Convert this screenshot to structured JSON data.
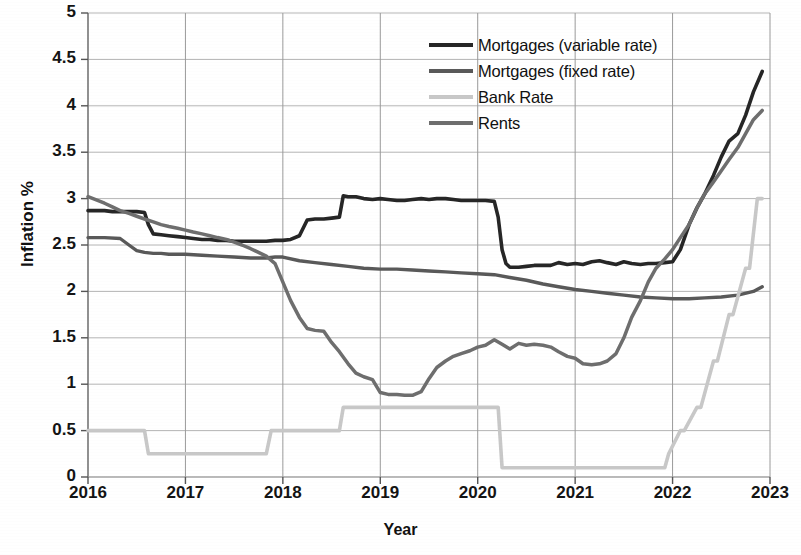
{
  "chart_data": {
    "type": "line",
    "title": "",
    "xlabel": "Year",
    "ylabel": "Inflation %",
    "xlim": [
      2016,
      2023
    ],
    "ylim": [
      0,
      5
    ],
    "grid": true,
    "legend_position": "top-center-right",
    "x_ticks": [
      "2016",
      "2017",
      "2018",
      "2019",
      "2020",
      "2021",
      "2022",
      "2023"
    ],
    "y_ticks": [
      "0",
      "0.5",
      "1",
      "1.5",
      "2",
      "2.5",
      "3",
      "3.5",
      "4",
      "4.5",
      "5"
    ],
    "series": [
      {
        "name": "Mortgages (variable rate)",
        "color": "#262626",
        "width": 3.6,
        "x": [
          2016.0,
          2016.08,
          2016.17,
          2016.25,
          2016.33,
          2016.42,
          2016.5,
          2016.58,
          2016.62,
          2016.67,
          2016.75,
          2016.83,
          2016.92,
          2017.0,
          2017.08,
          2017.17,
          2017.25,
          2017.33,
          2017.42,
          2017.5,
          2017.58,
          2017.67,
          2017.75,
          2017.83,
          2017.92,
          2018.0,
          2018.08,
          2018.17,
          2018.25,
          2018.33,
          2018.42,
          2018.5,
          2018.58,
          2018.62,
          2018.67,
          2018.75,
          2018.83,
          2018.92,
          2019.0,
          2019.08,
          2019.17,
          2019.25,
          2019.33,
          2019.42,
          2019.5,
          2019.58,
          2019.67,
          2019.75,
          2019.83,
          2019.92,
          2020.0,
          2020.08,
          2020.17,
          2020.21,
          2020.25,
          2020.29,
          2020.33,
          2020.42,
          2020.5,
          2020.58,
          2020.67,
          2020.75,
          2020.83,
          2020.92,
          2021.0,
          2021.08,
          2021.17,
          2021.25,
          2021.33,
          2021.42,
          2021.5,
          2021.58,
          2021.67,
          2021.75,
          2021.83,
          2021.92,
          2022.0,
          2022.08,
          2022.17,
          2022.25,
          2022.33,
          2022.42,
          2022.5,
          2022.58,
          2022.67,
          2022.75,
          2022.83,
          2022.92
        ],
        "y": [
          2.87,
          2.87,
          2.87,
          2.86,
          2.86,
          2.86,
          2.86,
          2.85,
          2.72,
          2.62,
          2.61,
          2.6,
          2.59,
          2.58,
          2.57,
          2.56,
          2.56,
          2.55,
          2.55,
          2.54,
          2.54,
          2.54,
          2.54,
          2.54,
          2.55,
          2.55,
          2.56,
          2.6,
          2.77,
          2.78,
          2.78,
          2.79,
          2.8,
          3.03,
          3.02,
          3.02,
          3.0,
          2.99,
          3.0,
          2.99,
          2.98,
          2.98,
          2.99,
          3.0,
          2.99,
          3.0,
          3.0,
          2.99,
          2.98,
          2.98,
          2.98,
          2.98,
          2.97,
          2.8,
          2.45,
          2.3,
          2.26,
          2.26,
          2.27,
          2.28,
          2.28,
          2.28,
          2.31,
          2.29,
          2.3,
          2.29,
          2.32,
          2.33,
          2.31,
          2.29,
          2.32,
          2.3,
          2.29,
          2.3,
          2.3,
          2.31,
          2.32,
          2.45,
          2.72,
          2.9,
          3.05,
          3.25,
          3.45,
          3.62,
          3.7,
          3.9,
          4.15,
          4.37
        ]
      },
      {
        "name": "Mortgages (fixed rate)",
        "color": "#595959",
        "width": 3.4,
        "x": [
          2016.0,
          2016.17,
          2016.33,
          2016.42,
          2016.5,
          2016.58,
          2016.67,
          2016.75,
          2016.83,
          2016.92,
          2017.0,
          2017.17,
          2017.33,
          2017.5,
          2017.67,
          2017.83,
          2017.92,
          2018.0,
          2018.17,
          2018.33,
          2018.5,
          2018.67,
          2018.83,
          2019.0,
          2019.17,
          2019.33,
          2019.5,
          2019.67,
          2019.83,
          2020.0,
          2020.17,
          2020.33,
          2020.5,
          2020.67,
          2020.83,
          2021.0,
          2021.17,
          2021.33,
          2021.5,
          2021.67,
          2021.83,
          2022.0,
          2022.17,
          2022.33,
          2022.5,
          2022.67,
          2022.83,
          2022.92
        ],
        "y": [
          2.58,
          2.58,
          2.57,
          2.5,
          2.44,
          2.42,
          2.41,
          2.41,
          2.4,
          2.4,
          2.4,
          2.39,
          2.38,
          2.37,
          2.36,
          2.36,
          2.37,
          2.37,
          2.33,
          2.31,
          2.29,
          2.27,
          2.25,
          2.24,
          2.24,
          2.23,
          2.22,
          2.21,
          2.2,
          2.19,
          2.18,
          2.15,
          2.12,
          2.08,
          2.05,
          2.02,
          2.0,
          1.98,
          1.96,
          1.94,
          1.93,
          1.92,
          1.92,
          1.93,
          1.94,
          1.96,
          2.0,
          2.05
        ]
      },
      {
        "name": "Bank Rate",
        "color": "#c8c8c8",
        "width": 3.6,
        "x": [
          2016.0,
          2016.58,
          2016.62,
          2017.83,
          2017.88,
          2018.58,
          2018.62,
          2020.21,
          2020.25,
          2021.92,
          2021.96,
          2022.08,
          2022.12,
          2022.25,
          2022.29,
          2022.42,
          2022.46,
          2022.58,
          2022.62,
          2022.75,
          2022.79,
          2022.87,
          2022.92
        ],
        "y": [
          0.5,
          0.5,
          0.25,
          0.25,
          0.5,
          0.5,
          0.75,
          0.75,
          0.1,
          0.1,
          0.25,
          0.5,
          0.5,
          0.75,
          0.75,
          1.25,
          1.25,
          1.75,
          1.75,
          2.25,
          2.25,
          3.0,
          3.0
        ]
      },
      {
        "name": "Rents",
        "color": "#6e6e6e",
        "width": 3.5,
        "x": [
          2016.0,
          2016.17,
          2016.25,
          2016.33,
          2016.42,
          2016.5,
          2016.58,
          2016.67,
          2016.75,
          2016.83,
          2016.92,
          2017.0,
          2017.08,
          2017.17,
          2017.25,
          2017.33,
          2017.42,
          2017.5,
          2017.58,
          2017.67,
          2017.75,
          2017.83,
          2017.92,
          2018.0,
          2018.08,
          2018.17,
          2018.25,
          2018.33,
          2018.42,
          2018.5,
          2018.58,
          2018.67,
          2018.75,
          2018.83,
          2018.92,
          2019.0,
          2019.08,
          2019.17,
          2019.25,
          2019.33,
          2019.42,
          2019.5,
          2019.58,
          2019.67,
          2019.75,
          2019.83,
          2019.92,
          2020.0,
          2020.08,
          2020.17,
          2020.25,
          2020.33,
          2020.42,
          2020.5,
          2020.58,
          2020.67,
          2020.75,
          2020.83,
          2020.92,
          2021.0,
          2021.08,
          2021.17,
          2021.25,
          2021.33,
          2021.42,
          2021.5,
          2021.58,
          2021.67,
          2021.75,
          2021.83,
          2021.92,
          2022.0,
          2022.08,
          2022.17,
          2022.25,
          2022.33,
          2022.42,
          2022.5,
          2022.58,
          2022.67,
          2022.75,
          2022.83,
          2022.92
        ],
        "y": [
          3.02,
          2.95,
          2.91,
          2.87,
          2.84,
          2.81,
          2.78,
          2.75,
          2.72,
          2.7,
          2.68,
          2.66,
          2.64,
          2.62,
          2.6,
          2.58,
          2.56,
          2.53,
          2.5,
          2.46,
          2.42,
          2.38,
          2.3,
          2.1,
          1.9,
          1.72,
          1.6,
          1.58,
          1.57,
          1.45,
          1.35,
          1.22,
          1.12,
          1.08,
          1.05,
          0.91,
          0.89,
          0.89,
          0.88,
          0.88,
          0.92,
          1.06,
          1.18,
          1.25,
          1.3,
          1.33,
          1.36,
          1.4,
          1.42,
          1.48,
          1.43,
          1.38,
          1.44,
          1.42,
          1.43,
          1.42,
          1.4,
          1.35,
          1.3,
          1.28,
          1.22,
          1.21,
          1.22,
          1.25,
          1.33,
          1.5,
          1.72,
          1.9,
          2.1,
          2.25,
          2.35,
          2.45,
          2.58,
          2.72,
          2.9,
          3.05,
          3.18,
          3.3,
          3.42,
          3.55,
          3.7,
          3.85,
          3.95
        ]
      }
    ]
  },
  "axis": {
    "ylabel": "Inflation %",
    "xlabel": "Year"
  }
}
